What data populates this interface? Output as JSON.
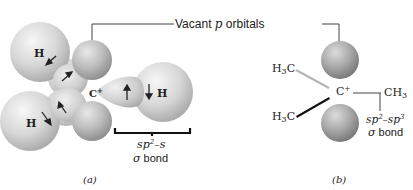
{
  "figure": {
    "callout": {
      "label_prefix": "Vacant ",
      "label_italic": "p",
      "label_suffix": " orbitals"
    },
    "panel_a": {
      "caption": "(a)",
      "central_atom": "C",
      "central_charge": "+",
      "hydrogens": [
        "H",
        "H",
        "H"
      ],
      "bond_label_line1_prefix": "sp",
      "bond_label_line1_sup": "2",
      "bond_label_line1_suffix": "–s",
      "bond_label_line2_greek": "σ",
      "bond_label_line2_text": " bond"
    },
    "panel_b": {
      "caption": "(b)",
      "central_atom": "C",
      "central_charge": "+",
      "groups": [
        {
          "main": "H",
          "sub": "3",
          "tail": "C"
        },
        {
          "main": "H",
          "sub": "3",
          "tail": "C"
        },
        {
          "main": "CH",
          "sub": "3",
          "tail": ""
        }
      ],
      "bond_label_line1_a": "sp",
      "bond_label_line1_sup_a": "2",
      "bond_label_line1_mid": "–sp",
      "bond_label_line1_sup_b": "3",
      "bond_label_line2_greek": "σ",
      "bond_label_line2_text": " bond"
    },
    "colors": {
      "sphere_light": "#f2f2f2",
      "sphere_mid": "#c9c9c9",
      "sphere_dark": "#9a9a9a",
      "p_orbital_dark": "#7d7d7d",
      "line": "#444444",
      "text": "#222222"
    }
  }
}
